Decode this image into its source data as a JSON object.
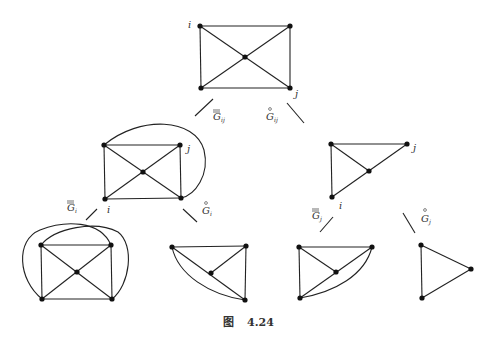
{
  "figure": {
    "caption_prefix": "图",
    "caption_number": "4.24"
  },
  "labels": {
    "top_i": "i",
    "top_j": "j",
    "branch_left": "G",
    "branch_left_sub": "ij",
    "branch_right": "G",
    "branch_right_sub": "ij",
    "midleft_i": "i",
    "midleft_j": "j",
    "midright_i": "i",
    "midright_j": "j",
    "ml_branch_left": "G",
    "ml_branch_left_sub": "i",
    "ml_branch_right": "G",
    "ml_branch_right_sub": "i",
    "mr_branch_left": "G",
    "mr_branch_left_sub": "j",
    "mr_branch_right": "G",
    "mr_branch_right_sub": "j"
  }
}
